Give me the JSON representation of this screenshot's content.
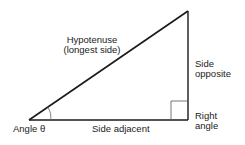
{
  "diagram": {
    "type": "right-triangle",
    "labels": {
      "hypotenuse_line1": "Hypotenuse",
      "hypotenuse_line2": "(longest side)",
      "opposite_line1": "Side",
      "opposite_line2": "opposite",
      "adjacent": "Side adjacent",
      "angle": "Angle θ",
      "right_angle_line1": "Right",
      "right_angle_line2": "angle"
    },
    "colors": {
      "stroke": "#1a1a1a",
      "text": "#222222",
      "background": "#ffffff"
    }
  }
}
